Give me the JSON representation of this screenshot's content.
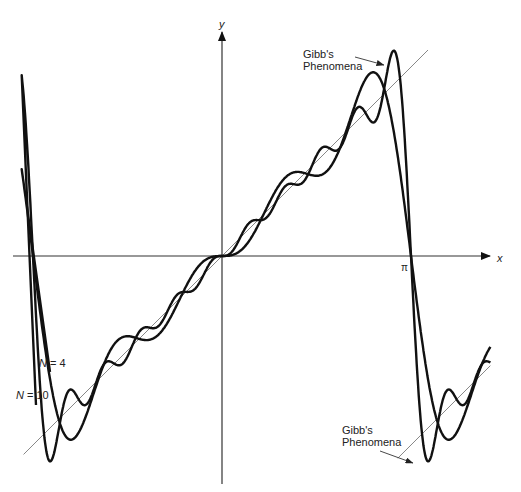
{
  "chart_data": {
    "type": "line",
    "title": "",
    "function": "f(x) = x on (-π, π), periodic extension; Fourier partial sums S_N(x) = 2 Σ_{n=1..N} (-1)^(n+1) sin(nx)/n",
    "xlabel": "x",
    "ylabel": "y",
    "x_tick_labels": [
      "π"
    ],
    "xlim": [
      -1.06,
      1.42
    ],
    "xlim_units": "multiples of π",
    "series": [
      {
        "name": "N = 4",
        "terms": 4,
        "style": "thick black"
      },
      {
        "name": "N = 10",
        "terms": 10,
        "style": "thick black"
      },
      {
        "name": "y = x",
        "style": "thin gray",
        "segments": [
          [
            -1.05,
            1.0
          ],
          [
            1.0,
            1.4
          ]
        ]
      }
    ],
    "annotations": [
      {
        "text": "Gibb's Phenomena",
        "location": "overshoot near x = π (top)"
      },
      {
        "text": "Gibb's Phenomena",
        "location": "undershoot just past x = π (bottom)"
      }
    ]
  },
  "axes": {
    "x_label": "x",
    "y_label": "y",
    "pi_label": "π"
  },
  "labels": {
    "n4": "N = 4",
    "n10": "N = 10",
    "gibbs_top_line1": "Gibb's",
    "gibbs_top_line2": "Phenomena",
    "gibbs_bottom_line1": "Gibb's",
    "gibbs_bottom_line2": "Phenomena"
  },
  "geometry": {
    "origin_x": 222,
    "origin_y": 256,
    "pi_px": 189
  }
}
